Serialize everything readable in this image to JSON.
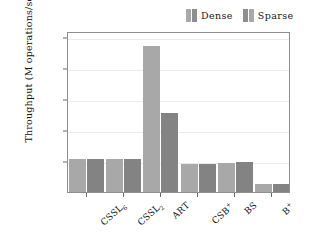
{
  "chart_data": {
    "type": "bar",
    "title": "",
    "xlabel": "",
    "ylabel": "Throughput (M operations/second)",
    "categories": [
      "CSSL6",
      "CSSL2",
      "ART",
      "CSB+",
      "BS",
      "B+"
    ],
    "category_labels_html": [
      "CSSL<sub>6</sub>",
      "CSSL<sub>2</sub>",
      "ART",
      "CSB<sup>+</sup>",
      "BS",
      "B<sup>+</sup>"
    ],
    "series": [
      {
        "name": "Dense",
        "values": [
          2.7,
          2.7,
          11.8,
          2.3,
          2.35,
          0.65
        ],
        "color": "#a8a8a8"
      },
      {
        "name": "Sparse",
        "values": [
          2.7,
          2.7,
          6.4,
          2.3,
          2.4,
          0.65
        ],
        "color": "#838383"
      }
    ],
    "ylim": [
      0,
      13.0
    ],
    "yticks": [
      2.5,
      5,
      7.5,
      10,
      12.5
    ],
    "ytick_labels": [
      "2.5",
      "5",
      "7.5",
      "10",
      "12.5"
    ],
    "grid": true,
    "legend_position": "top-right"
  },
  "legend": {
    "entries": [
      {
        "label": "Dense",
        "swatch_a": "#a8a8a8",
        "swatch_b": "#8f8f8f"
      },
      {
        "label": "Sparse",
        "swatch_a": "#8f8f8f",
        "swatch_b": "#a8a8a8"
      }
    ]
  },
  "axes": {
    "y_title": "Throughput (M operations/second)"
  },
  "colors": {
    "dense": "#a8a8a8",
    "sparse": "#838383",
    "frame": "#8e8e8e",
    "grid": "#eceaea",
    "text": "#141414",
    "background": "#ffffff"
  }
}
